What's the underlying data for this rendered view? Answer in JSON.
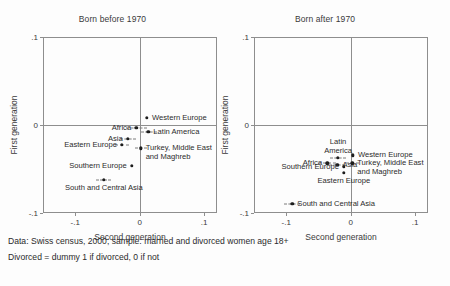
{
  "figure": {
    "caption_line1": "Data: Swiss census, 2000; sample: married and divorced women age 18+",
    "caption_line2": "Divorced = dummy 1 if divorced, 0 if not"
  },
  "chart_data": {
    "type": "scatter",
    "title": "",
    "xlabel": "Second generation",
    "ylabel": "First generation",
    "xlim": [
      -0.15,
      0.12
    ],
    "ylim": [
      -0.1,
      0.1
    ],
    "xticks": [
      -0.1,
      0,
      0.1
    ],
    "xticklabels": [
      "-.1",
      "0",
      ".1"
    ],
    "yticks": [
      -0.1,
      0,
      0.1
    ],
    "yticklabels": [
      "-.1",
      "0",
      ".1"
    ],
    "grid": false,
    "legend": "none",
    "reference_lines": {
      "x": 0,
      "y": 0
    },
    "panels": [
      {
        "title": "Born before 1970",
        "points": [
          {
            "label": "Western Europe",
            "x": 0.0115,
            "y": 0.0085,
            "ci_lo": 0.0115,
            "ci_hi": 0.0115,
            "label_pos": "right"
          },
          {
            "label": "Africa",
            "x": -0.0055,
            "y": -0.0035,
            "ci_lo": -0.021,
            "ci_hi": 0.012,
            "label_pos": "left"
          },
          {
            "label": "Latin America",
            "x": 0.0135,
            "y": -0.0075,
            "ci_lo": 0.0025,
            "ci_hi": 0.027,
            "label_pos": "right"
          },
          {
            "label": "Asia",
            "x": -0.0185,
            "y": -0.016,
            "ci_lo": -0.0305,
            "ci_hi": -0.006,
            "label_pos": "left"
          },
          {
            "label": "Eastern Europe",
            "x": -0.0275,
            "y": -0.0225,
            "ci_lo": -0.039,
            "ci_hi": -0.016,
            "label_pos": "left"
          },
          {
            "label": "Turkey, Middle East and Maghreb",
            "x": 0.0015,
            "y": -0.0265,
            "ci_lo": -0.008,
            "ci_hi": 0.011,
            "label_pos": "right"
          },
          {
            "label": "Southern Europe",
            "x": -0.0125,
            "y": -0.0465,
            "ci_lo": -0.0125,
            "ci_hi": -0.0125,
            "label_pos": "left"
          },
          {
            "label": "South and Central Asia",
            "x": -0.0555,
            "y": -0.0625,
            "ci_lo": -0.067,
            "ci_hi": -0.044,
            "label_pos": "below"
          }
        ]
      },
      {
        "title": "Born after 1970",
        "points": [
          {
            "label": "Western Europe",
            "x": 0.0035,
            "y": -0.0345,
            "ci_lo": 0.0035,
            "ci_hi": 0.0035,
            "label_pos": "right"
          },
          {
            "label": "Latin America",
            "x": -0.0195,
            "y": -0.0375,
            "ci_lo": -0.032,
            "ci_hi": -0.007,
            "label_pos": "above"
          },
          {
            "label": "Africa",
            "x": -0.0365,
            "y": -0.0435,
            "ci_lo": -0.05,
            "ci_hi": -0.023,
            "label_pos": "left"
          },
          {
            "label": "Asia",
            "x": -0.0205,
            "y": -0.0455,
            "ci_lo": -0.033,
            "ci_hi": -0.009,
            "label_pos": "right"
          },
          {
            "label": "Turkey, Middle East and Maghreb",
            "x": 0.0025,
            "y": -0.0435,
            "ci_lo": -0.008,
            "ci_hi": 0.013,
            "label_pos": "right"
          },
          {
            "label": "Southern Europe",
            "x": -0.0105,
            "y": -0.0475,
            "ci_lo": -0.0105,
            "ci_hi": -0.0105,
            "label_pos": "left"
          },
          {
            "label": "Eastern Europe",
            "x": -0.0105,
            "y": -0.0545,
            "ci_lo": -0.0105,
            "ci_hi": -0.0105,
            "label_pos": "below"
          },
          {
            "label": "South and Central Asia",
            "x": -0.0905,
            "y": -0.0895,
            "ci_lo": -0.103,
            "ci_hi": -0.078,
            "label_pos": "right"
          }
        ]
      }
    ]
  }
}
